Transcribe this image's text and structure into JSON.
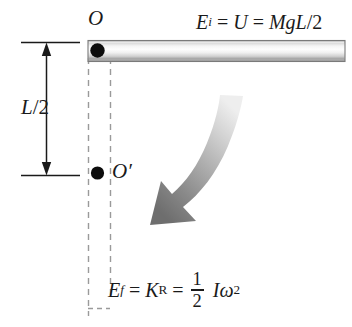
{
  "figure": {
    "background_color": "#ffffff",
    "ink_color": "#1a1a1a"
  },
  "labels": {
    "pivot_top": "O",
    "pivot_center": "O′",
    "dimension": {
      "symbol": "L",
      "slash": "/",
      "denominator": "2",
      "full": "L/2"
    }
  },
  "equations": {
    "initial": {
      "lhs_symbol": "E",
      "lhs_subscript": "i",
      "equals": "=",
      "mid": "U",
      "equals2": "=",
      "rhs": "MgL/2",
      "rhs_parts": {
        "M": "M",
        "g": "g",
        "L": "L",
        "slash": "/",
        "two": "2"
      },
      "plain": "E_i = U = MgL/2"
    },
    "final": {
      "lhs_symbol": "E",
      "lhs_subscript": "f",
      "equals": "=",
      "mid_symbol": "K",
      "mid_subscript": "R",
      "equals2": "=",
      "fraction_numerator": "1",
      "fraction_denominator": "2",
      "inertia": "I",
      "omega": "ω",
      "omega_exponent": "2",
      "plain": "E_f = K_R = 1/2 Iω²"
    }
  },
  "elements": {
    "rod": {
      "name": "horizontal-rod",
      "orientation": "horizontal",
      "shading": "cylindrical-gradient",
      "outline_color": "#6e6e6e",
      "highlight_color": "#fcfcfc",
      "shadow_color": "#b9b9b9"
    },
    "rotation_arrow": {
      "name": "rotation-direction-arrow",
      "direction": "clockwise-downward",
      "fill": "gradient-light-to-dark-gray",
      "light_color": "#e4e4e4",
      "dark_color": "#6b6b6b"
    },
    "dimension_line": {
      "name": "L-over-2-dimension",
      "style": "double-headed-arrow",
      "color": "#1a1a1a"
    },
    "dashed_guides": {
      "name": "vertical-dashed-guides",
      "count": 2,
      "color": "#9a9a9a",
      "dash_pattern": "6 5"
    },
    "pivot_dots": {
      "name": "pivot-point-dots",
      "count": 2,
      "color": "#0d0d0d"
    }
  }
}
